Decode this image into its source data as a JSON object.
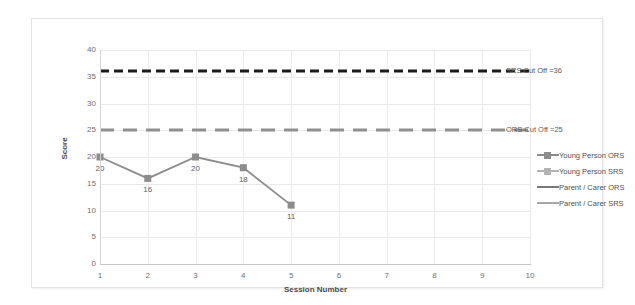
{
  "chart_data": {
    "type": "line",
    "title": "",
    "xlabel": "Session Number",
    "ylabel": "Score",
    "xlim": [
      1,
      10
    ],
    "ylim": [
      0,
      40
    ],
    "ytick_labels": [
      "40",
      "35",
      "30",
      "25",
      "20",
      "15",
      "10",
      "5",
      "0"
    ],
    "ytick_values": [
      40,
      35,
      30,
      25,
      20,
      15,
      10,
      5,
      0
    ],
    "xtick_labels": [
      "1",
      "2",
      "3",
      "4",
      "5",
      "6",
      "7",
      "8",
      "9",
      "10"
    ],
    "xtick_values": [
      1,
      2,
      3,
      4,
      5,
      6,
      7,
      8,
      9,
      10
    ],
    "grid": true,
    "legend_position": "right",
    "series": [
      {
        "name": "Young Person ORS",
        "x": [
          1,
          2,
          3,
          4,
          5
        ],
        "values": [
          20,
          16,
          20,
          18,
          11
        ],
        "data_labels": [
          "20",
          "16",
          "20",
          "18",
          "11"
        ],
        "color": "#8c8c8c",
        "style": "solid-marker"
      },
      {
        "name": "Young Person SRS",
        "x": [],
        "values": [],
        "data_labels": [],
        "color": "#b3b3b3",
        "style": "solid-marker"
      },
      {
        "name": "Parent / Carer ORS",
        "x": [],
        "values": [],
        "data_labels": [],
        "color": "#7a7a7a",
        "style": "solid"
      },
      {
        "name": "Parent / Carer SRS",
        "x": [],
        "values": [],
        "data_labels": [],
        "color": "#a6a6a6",
        "style": "solid"
      }
    ],
    "reference_lines": [
      {
        "name": "SRS Cut Off",
        "label": "SRS Cut Off =36",
        "value": 36,
        "color": "#1a1a1a",
        "style": "dashed"
      },
      {
        "name": "ORS Cut Off",
        "label": "ORS Cut Off =25",
        "value": 25,
        "color": "#8f8f8f",
        "style": "dashed"
      }
    ]
  },
  "legend": {
    "items": [
      {
        "label": "Young Person ORS"
      },
      {
        "label": "Young Person SRS"
      },
      {
        "label": "Parent / Carer ORS"
      },
      {
        "label": "Parent / Carer SRS"
      }
    ]
  }
}
